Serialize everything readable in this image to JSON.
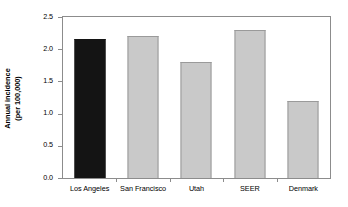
{
  "chart_data": {
    "type": "bar",
    "title": "",
    "subtitle": "",
    "xlabel": "",
    "ylabel": "Annual incidence (per 100,000)",
    "ylabel_lines": [
      "Annual incidence",
      "(per 100,000)"
    ],
    "categories": [
      "Los Angeles",
      "San Francisco",
      "Utah",
      "SEER",
      "Denmark"
    ],
    "values": [
      2.16,
      2.2,
      1.8,
      2.3,
      1.2
    ],
    "bar_colors": [
      "#141414",
      "#c9c9c9",
      "#c9c9c9",
      "#c9c9c9",
      "#c9c9c9"
    ],
    "highlighted_category": "Los Angeles",
    "ylim": [
      0.0,
      2.5
    ],
    "ytick_values": [
      0.0,
      0.5,
      1.0,
      1.5,
      2.0,
      2.5
    ],
    "ytick_labels": [
      "0.0",
      "0.5",
      "1.0",
      "1.5",
      "2.0",
      "2.5"
    ],
    "grid": false,
    "legend": null,
    "legend_position": "none",
    "frame": true,
    "annotations": []
  },
  "figure": {
    "background_color": "#ffffff",
    "axis_color": "#8c8c8c",
    "text_color": "#000000",
    "bar_edge_color": "#9a9a9a",
    "accent_color": "#141414"
  }
}
